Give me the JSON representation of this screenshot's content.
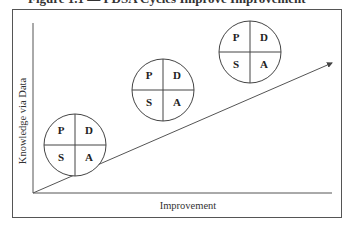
{
  "figure": {
    "title": "Figure 1.1 — PDSA Cycles Improve Improvement",
    "y_axis_label": "Knowledge via Data",
    "x_axis_label": "Improvement",
    "arrow": {
      "from": [
        33,
        193
      ],
      "to": [
        333,
        62
      ]
    },
    "cycles": [
      {
        "center": [
          75,
          145
        ],
        "radius": 31,
        "quadrants": {
          "top_left": "P",
          "top_right": "D",
          "bottom_left": "S",
          "bottom_right": "A"
        }
      },
      {
        "center": [
          163,
          90
        ],
        "radius": 31,
        "quadrants": {
          "top_left": "P",
          "top_right": "D",
          "bottom_left": "S",
          "bottom_right": "A"
        }
      },
      {
        "center": [
          250,
          52
        ],
        "radius": 31,
        "quadrants": {
          "top_left": "P",
          "top_right": "D",
          "bottom_left": "S",
          "bottom_right": "A"
        }
      }
    ]
  }
}
